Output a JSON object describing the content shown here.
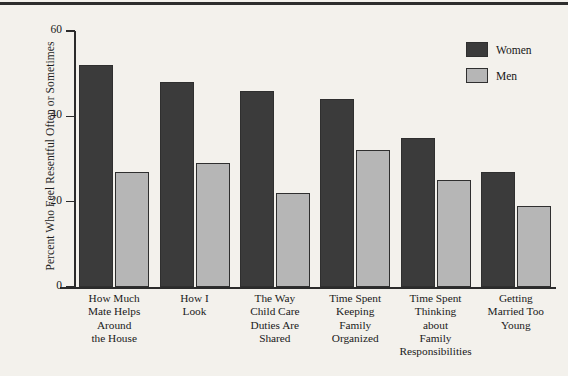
{
  "chart_data": {
    "type": "bar",
    "title": "",
    "xlabel": "",
    "ylabel": "Percent Who Feel Resentful Often or Sometimes",
    "ylim": [
      0,
      60
    ],
    "yticks": [
      "0",
      "20",
      "40",
      "60"
    ],
    "grid": false,
    "legend_position": "top-right",
    "categories": [
      "How Much Mate Helps Around the House",
      "How I Look",
      "The Way Child Care Duties Are Shared",
      "Time Spent Keeping Family Organized",
      "Time Spent Thinking about Family Responsibilities",
      "Getting Married Too Young"
    ],
    "category_lines": [
      [
        "How Much",
        "Mate Helps",
        "Around",
        "the House"
      ],
      [
        "How I",
        "Look"
      ],
      [
        "The Way",
        "Child Care",
        "Duties Are",
        "Shared"
      ],
      [
        "Time Spent",
        "Keeping",
        "Family",
        "Organized"
      ],
      [
        "Time Spent",
        "Thinking",
        "about",
        "Family",
        "Responsibilities"
      ],
      [
        "Getting",
        "Married Too",
        "Young"
      ]
    ],
    "series": [
      {
        "name": "Women",
        "color": "#3b3b3b",
        "values": [
          52,
          48,
          46,
          44,
          35,
          27
        ]
      },
      {
        "name": "Men",
        "color": "#b6b6b6",
        "values": [
          27,
          29,
          22,
          32,
          25,
          19
        ]
      }
    ]
  },
  "legend": {
    "items": [
      {
        "label": "Women",
        "color": "#3b3b3b"
      },
      {
        "label": "Men",
        "color": "#b6b6b6"
      }
    ]
  },
  "colors": {
    "background": "#f3f1ec",
    "axis": "#2b2b2b",
    "text": "#1a1a1a",
    "women": "#3b3b3b",
    "men": "#b6b6b6"
  }
}
